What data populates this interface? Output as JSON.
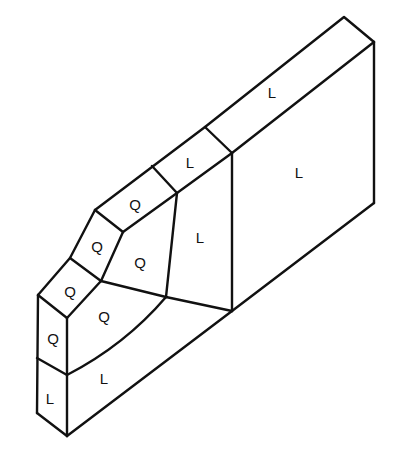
{
  "diagram": {
    "type": "isometric finite-element mesh block",
    "element_types": {
      "Q": "quadratic element",
      "L": "linear element"
    },
    "labels": [
      {
        "id": "top-strip-right",
        "text": "L",
        "x": 272,
        "y": 92
      },
      {
        "id": "right-face",
        "text": "L",
        "x": 299,
        "y": 172
      },
      {
        "id": "top-strip-mid",
        "text": "L",
        "x": 190,
        "y": 162
      },
      {
        "id": "top-strip-q",
        "text": "Q",
        "x": 135,
        "y": 204
      },
      {
        "id": "center-l",
        "text": "L",
        "x": 200,
        "y": 237
      },
      {
        "id": "center-q-upper",
        "text": "Q",
        "x": 140,
        "y": 262
      },
      {
        "id": "bevel-q-upper",
        "text": "Q",
        "x": 97,
        "y": 246
      },
      {
        "id": "bevel-q-lower",
        "text": "Q",
        "x": 70,
        "y": 291
      },
      {
        "id": "center-q-lower",
        "text": "Q",
        "x": 104,
        "y": 316
      },
      {
        "id": "front-q",
        "text": "Q",
        "x": 53,
        "y": 338
      },
      {
        "id": "bottom-l",
        "text": "L",
        "x": 104,
        "y": 378
      },
      {
        "id": "front-l",
        "text": "L",
        "x": 50,
        "y": 398
      }
    ]
  }
}
